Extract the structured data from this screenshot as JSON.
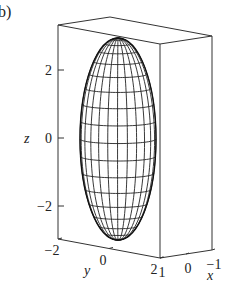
{
  "panel_label": "b)",
  "chart_data": {
    "type": "surface-wireframe",
    "title": "",
    "surface": "ellipsoid",
    "semi_axes": {
      "x": 1,
      "y": 1,
      "z": 3
    },
    "meridians": 24,
    "parallels": 18,
    "xlabel": "x",
    "ylabel": "y",
    "zlabel": "z",
    "xlim": [
      -1,
      1
    ],
    "ylim": [
      -2,
      2
    ],
    "zlim": [
      -3,
      3
    ],
    "x_ticks": [
      {
        "value": 1,
        "label": "1"
      },
      {
        "value": 0,
        "label": "0"
      },
      {
        "value": -1,
        "label": "−1"
      }
    ],
    "y_ticks": [
      {
        "value": -2,
        "label": "−2"
      },
      {
        "value": 0,
        "label": "0"
      },
      {
        "value": 2,
        "label": "2"
      }
    ],
    "z_ticks": [
      {
        "value": 2,
        "label": "2"
      },
      {
        "value": 0,
        "label": "0"
      },
      {
        "value": -2,
        "label": "−2"
      }
    ],
    "grid": false,
    "box": true
  }
}
